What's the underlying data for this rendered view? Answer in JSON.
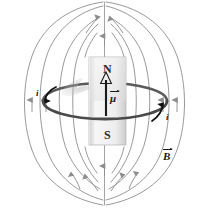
{
  "figure": {
    "background_color": "#ffffff"
  },
  "magnet": {
    "north_label": "N",
    "south_label": "S",
    "fill_top_color": "#f0f0f0",
    "fill_bottom_color": "#e2e2e2",
    "border_color": "#b4b4b4",
    "x": 89,
    "y": 57,
    "width": 37,
    "height": 88
  },
  "moment_vector": {
    "label": "μ",
    "has_overbar_arrow": true,
    "color": "#1a1a1a",
    "tail_y": 116,
    "tip_y": 74,
    "x": 106
  },
  "current_loop": {
    "center_x": 105,
    "center_y": 101,
    "radius_x": 62,
    "radius_y": 18,
    "color": "#5a5a5a",
    "stroke_width": 2.6
  },
  "current_labels": [
    {
      "name": "current-left",
      "text": "i",
      "x": 36,
      "y": 89
    },
    {
      "name": "current-right",
      "text": "i",
      "x": 166,
      "y": 113
    }
  ],
  "field": {
    "label": "B",
    "has_overbar_arrow": true,
    "label_x": 163,
    "label_y": 152,
    "line_color": "#8d8d8d",
    "arrow_color": "#8d8d8d",
    "stroke_width": 0.9,
    "description": "closed magnetic field loops exiting N pole and entering S pole"
  },
  "swoosh": {
    "name": "gray-swoosh-highlight",
    "color": "#9e9e9e",
    "opacity": 0.55
  }
}
